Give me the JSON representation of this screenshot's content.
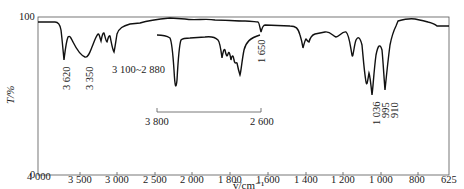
{
  "chart_data": {
    "type": "line",
    "title": "",
    "xlabel": "ṽ/cm⁻¹",
    "ylabel": "T/%",
    "xlim": [
      4000,
      625
    ],
    "ylim": [
      0,
      100
    ],
    "grid": false,
    "legend": null,
    "y_ticks": [
      "100",
      "0"
    ],
    "x_ticks": [
      "4 000",
      "3 500",
      "3 000",
      "2 500",
      "2 000",
      "1 800",
      "1 600",
      "1 400",
      "1 200",
      "1 000",
      "800",
      "625"
    ],
    "annotations": [
      {
        "label": "3 620",
        "x": 3620,
        "orientation": "vertical"
      },
      {
        "label": "3 350",
        "x": 3350,
        "orientation": "vertical"
      },
      {
        "label": "3 100~2 880",
        "x": 3000,
        "orientation": "horizontal"
      },
      {
        "label": "1 650",
        "x": 1650,
        "orientation": "vertical"
      },
      {
        "label": "1 036",
        "x": 1036,
        "orientation": "vertical"
      },
      {
        "label": "995",
        "x": 995,
        "orientation": "vertical"
      },
      {
        "label": "910",
        "x": 910,
        "orientation": "vertical"
      }
    ],
    "series": [
      {
        "name": "main spectrum",
        "points": [
          [
            4000,
            95
          ],
          [
            3750,
            95
          ],
          [
            3680,
            90
          ],
          [
            3620,
            55
          ],
          [
            3580,
            80
          ],
          [
            3500,
            72
          ],
          [
            3350,
            67
          ],
          [
            3250,
            78
          ],
          [
            3150,
            85
          ],
          [
            3100,
            78
          ],
          [
            3060,
            84
          ],
          [
            3020,
            75
          ],
          [
            2990,
            81
          ],
          [
            2960,
            72
          ],
          [
            2920,
            66
          ],
          [
            2880,
            72
          ],
          [
            2850,
            86
          ],
          [
            2800,
            89
          ],
          [
            2600,
            91
          ],
          [
            2400,
            92
          ],
          [
            2200,
            90
          ],
          [
            2000,
            92
          ],
          [
            1900,
            91
          ],
          [
            1800,
            92
          ],
          [
            1700,
            90
          ],
          [
            1660,
            89
          ],
          [
            1650,
            82
          ],
          [
            1640,
            88
          ],
          [
            1500,
            87
          ],
          [
            1450,
            85
          ],
          [
            1420,
            78
          ],
          [
            1400,
            69
          ],
          [
            1385,
            75
          ],
          [
            1370,
            78
          ],
          [
            1350,
            76
          ],
          [
            1300,
            84
          ],
          [
            1250,
            86
          ],
          [
            1200,
            80
          ],
          [
            1150,
            84
          ],
          [
            1100,
            74
          ],
          [
            1080,
            60
          ],
          [
            1060,
            70
          ],
          [
            1036,
            35
          ],
          [
            1020,
            42
          ],
          [
            995,
            35
          ],
          [
            960,
            75
          ],
          [
            930,
            68
          ],
          [
            910,
            40
          ],
          [
            890,
            72
          ],
          [
            860,
            90
          ],
          [
            820,
            97
          ],
          [
            760,
            97
          ],
          [
            720,
            95
          ],
          [
            680,
            92
          ],
          [
            625,
            92
          ]
        ]
      },
      {
        "name": "inset spectrum (3 800 – 2 600)",
        "inset_range": [
          3800,
          2600
        ],
        "points": [
          [
            3800,
            86
          ],
          [
            3640,
            84
          ],
          [
            3560,
            70
          ],
          [
            3550,
            42
          ],
          [
            3535,
            65
          ],
          [
            3500,
            82
          ],
          [
            3400,
            83
          ],
          [
            3200,
            83
          ],
          [
            3100,
            81
          ],
          [
            3060,
            70
          ],
          [
            3040,
            76
          ],
          [
            3010,
            68
          ],
          [
            2990,
            73
          ],
          [
            2960,
            64
          ],
          [
            2940,
            60
          ],
          [
            2920,
            70
          ],
          [
            2900,
            62
          ],
          [
            2880,
            55
          ],
          [
            2850,
            76
          ],
          [
            2800,
            82
          ],
          [
            2700,
            85
          ],
          [
            2600,
            86
          ]
        ]
      }
    ],
    "inset_scale": {
      "left_label": "3 800",
      "right_label": "2 600"
    }
  },
  "axis": {
    "y_label": "T/%",
    "y_top": "100",
    "y_bottom": "0",
    "x_label": "ṽ/cm⁻¹",
    "x_ticks": [
      "4 000",
      "3 500",
      "3 000",
      "2 500",
      "2 000",
      "1 800",
      "1 600",
      "1 400",
      "1 200",
      "1 000",
      "800",
      "625"
    ]
  },
  "annotations": {
    "a3620": "3 620",
    "a3350": "3 350",
    "a3100": "3 100~2 880",
    "a1650": "1 650",
    "a1036": "1 036",
    "a995": "995",
    "a910": "910",
    "inset_left": "3 800",
    "inset_right": "2 600"
  }
}
